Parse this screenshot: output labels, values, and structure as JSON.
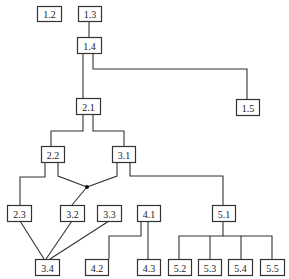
{
  "diagram": {
    "type": "hierarchy-tree",
    "colors": {
      "line": "#333333",
      "box_fill": "#ffffff",
      "text": "#222222"
    },
    "nodes": [
      {
        "id": "1.2",
        "label": "1.2",
        "x": 37,
        "y": 6,
        "w": 24,
        "h": 15
      },
      {
        "id": "1.3",
        "label": "1.3",
        "x": 78,
        "y": 6,
        "w": 23,
        "h": 15
      },
      {
        "id": "1.4",
        "label": "1.4",
        "x": 77,
        "y": 37,
        "w": 24,
        "h": 16
      },
      {
        "id": "1.5",
        "label": "1.5",
        "x": 236,
        "y": 99,
        "w": 23,
        "h": 16
      },
      {
        "id": "2.1",
        "label": "2.1",
        "x": 76,
        "y": 98,
        "w": 24,
        "h": 16
      },
      {
        "id": "2.2",
        "label": "2.2",
        "x": 41,
        "y": 146,
        "w": 23,
        "h": 16
      },
      {
        "id": "3.1",
        "label": "3.1",
        "x": 112,
        "y": 146,
        "w": 23,
        "h": 16
      },
      {
        "id": "2.3",
        "label": "2.3",
        "x": 7,
        "y": 205,
        "w": 24,
        "h": 16
      },
      {
        "id": "3.2",
        "label": "3.2",
        "x": 60,
        "y": 205,
        "w": 24,
        "h": 16
      },
      {
        "id": "3.3",
        "label": "3.3",
        "x": 97,
        "y": 205,
        "w": 24,
        "h": 16
      },
      {
        "id": "4.1",
        "label": "4.1",
        "x": 137,
        "y": 205,
        "w": 23,
        "h": 16
      },
      {
        "id": "5.1",
        "label": "5.1",
        "x": 212,
        "y": 205,
        "w": 23,
        "h": 16
      },
      {
        "id": "3.4",
        "label": "3.4",
        "x": 35,
        "y": 259,
        "w": 24,
        "h": 16
      },
      {
        "id": "4.2",
        "label": "4.2",
        "x": 85,
        "y": 259,
        "w": 23,
        "h": 16
      },
      {
        "id": "4.3",
        "label": "4.3",
        "x": 137,
        "y": 259,
        "w": 23,
        "h": 16
      },
      {
        "id": "5.2",
        "label": "5.2",
        "x": 168,
        "y": 259,
        "w": 23,
        "h": 16
      },
      {
        "id": "5.3",
        "label": "5.3",
        "x": 198,
        "y": 259,
        "w": 23,
        "h": 16
      },
      {
        "id": "5.4",
        "label": "5.4",
        "x": 228,
        "y": 259,
        "w": 24,
        "h": 16
      },
      {
        "id": "5.5",
        "label": "5.5",
        "x": 260,
        "y": 259,
        "w": 24,
        "h": 16
      }
    ],
    "junction": {
      "x": 87,
      "y": 187,
      "r": 2
    },
    "edges": [
      {
        "from": "1.3",
        "to": "1.4",
        "points": [
          [
            89,
            21
          ],
          [
            89,
            37
          ]
        ]
      },
      {
        "from": "1.4",
        "to": "2.1",
        "points": [
          [
            83,
            53
          ],
          [
            83,
            98
          ]
        ]
      },
      {
        "from": "1.4",
        "to": "1.5",
        "points": [
          [
            93,
            53
          ],
          [
            93,
            69
          ],
          [
            247,
            69
          ],
          [
            247,
            99
          ]
        ]
      },
      {
        "from": "2.1",
        "to": "2.2",
        "points": [
          [
            83,
            114
          ],
          [
            83,
            131
          ],
          [
            51,
            131
          ],
          [
            51,
            146
          ]
        ]
      },
      {
        "from": "2.1",
        "to": "3.1",
        "points": [
          [
            93,
            114
          ],
          [
            93,
            131
          ],
          [
            124,
            131
          ],
          [
            124,
            146
          ]
        ]
      },
      {
        "from": "2.2",
        "to": "2.3",
        "points": [
          [
            45,
            162
          ],
          [
            45,
            177
          ],
          [
            20,
            177
          ],
          [
            20,
            205
          ]
        ]
      },
      {
        "from": "2.2",
        "to": "junction",
        "points": [
          [
            58,
            162
          ],
          [
            58,
            176
          ],
          [
            87,
            187
          ]
        ]
      },
      {
        "from": "3.1",
        "to": "junction",
        "points": [
          [
            117,
            162
          ],
          [
            117,
            176
          ],
          [
            87,
            187
          ]
        ]
      },
      {
        "from": "junction",
        "to": "3.2",
        "points": [
          [
            87,
            187
          ],
          [
            72,
            205
          ]
        ]
      },
      {
        "from": "3.1",
        "to": "5.1",
        "points": [
          [
            130,
            162
          ],
          [
            130,
            176
          ],
          [
            223,
            176
          ],
          [
            223,
            205
          ]
        ]
      },
      {
        "from": "2.3",
        "to": "3.4",
        "points": [
          [
            20,
            221
          ],
          [
            44,
            259
          ]
        ]
      },
      {
        "from": "3.2",
        "to": "3.4",
        "points": [
          [
            72,
            221
          ],
          [
            46,
            259
          ]
        ]
      },
      {
        "from": "3.3",
        "to": "3.4",
        "points": [
          [
            109,
            221
          ],
          [
            50,
            259
          ]
        ]
      },
      {
        "from": "4.1",
        "to": "4.2",
        "points": [
          [
            141,
            221
          ],
          [
            141,
            236
          ],
          [
            109,
            236
          ],
          [
            109,
            259
          ]
        ]
      },
      {
        "from": "4.1",
        "to": "4.3",
        "points": [
          [
            148,
            221
          ],
          [
            148,
            259
          ]
        ]
      },
      {
        "from": "5.1",
        "to": "5.2",
        "points": [
          [
            223,
            221
          ],
          [
            223,
            236
          ],
          [
            179,
            236
          ],
          [
            179,
            259
          ]
        ]
      },
      {
        "from": "5.1",
        "to": "5.3",
        "points": [
          [
            210,
            236
          ],
          [
            210,
            259
          ]
        ]
      },
      {
        "from": "5.1",
        "to": "5.4",
        "points": [
          [
            223,
            236
          ],
          [
            241,
            236
          ],
          [
            241,
            259
          ]
        ]
      },
      {
        "from": "5.1",
        "to": "5.5",
        "points": [
          [
            241,
            236
          ],
          [
            272,
            236
          ],
          [
            272,
            259
          ]
        ]
      }
    ]
  }
}
